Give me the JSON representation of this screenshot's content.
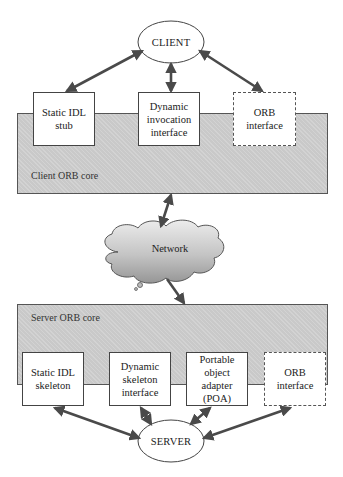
{
  "diagram": {
    "client": {
      "label": "CLIENT",
      "interfaces": [
        {
          "label": "Static IDL stub",
          "style": "solid"
        },
        {
          "label": "Dynamic invocation interface",
          "style": "solid"
        },
        {
          "label": "ORB interface",
          "style": "dashed"
        }
      ],
      "core_label": "Client ORB core"
    },
    "network": {
      "label": "Network"
    },
    "server": {
      "label": "SERVER",
      "interfaces": [
        {
          "label": "Static IDL skeleton",
          "style": "solid"
        },
        {
          "label": "Dynamic skeleton interface",
          "style": "solid"
        },
        {
          "label": "Portable object adapter (POA)",
          "style": "solid"
        },
        {
          "label": "ORB interface",
          "style": "dashed"
        }
      ],
      "core_label": "Server ORB core"
    },
    "colors": {
      "core_fill": "#c9c9c9",
      "arrow": "#4a4a4a",
      "cloud_top": "#e6e6e6",
      "cloud_bottom": "#9a9a9a"
    }
  }
}
